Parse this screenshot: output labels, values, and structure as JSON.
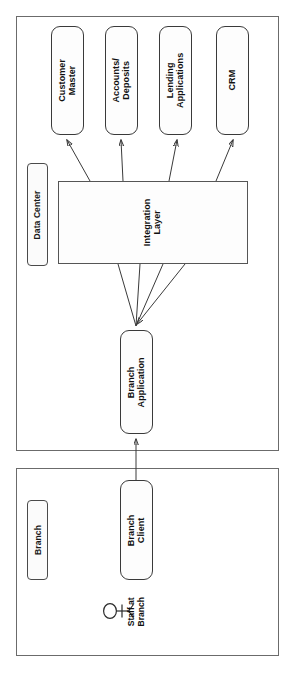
{
  "diagram": {
    "orientation": "rotated-90-ccw",
    "containers": [
      {
        "id": "data-center",
        "label": "Data Center"
      },
      {
        "id": "branch",
        "label": "Branch"
      }
    ],
    "nodes": [
      {
        "id": "customer-master",
        "label": "Customer\nMaster",
        "shape": "rounded-rect",
        "container": "data-center"
      },
      {
        "id": "accounts-deposits",
        "label": "Accounts/\nDeposits",
        "shape": "rounded-rect",
        "container": "data-center"
      },
      {
        "id": "lending-apps",
        "label": "Lending\nApplications",
        "shape": "rounded-rect",
        "container": "data-center"
      },
      {
        "id": "crm",
        "label": "CRM",
        "shape": "rounded-rect",
        "container": "data-center"
      },
      {
        "id": "integration-layer",
        "label": "Integration\nLayer",
        "shape": "rect",
        "container": "data-center"
      },
      {
        "id": "branch-app",
        "label": "Branch\nApplication",
        "shape": "rounded-rect",
        "container": "data-center"
      },
      {
        "id": "branch-client",
        "label": "Branch\nClient",
        "shape": "rounded-rect",
        "container": "branch"
      }
    ],
    "actors": [
      {
        "id": "staff-at-branch",
        "label": "Staff at\nBranch",
        "icon": "stick-figure-actor-icon",
        "container": "branch"
      }
    ],
    "edges": [
      {
        "from": "integration-layer",
        "to": "customer-master",
        "arrow": "end"
      },
      {
        "from": "integration-layer",
        "to": "accounts-deposits",
        "arrow": "end"
      },
      {
        "from": "integration-layer",
        "to": "lending-apps",
        "arrow": "end"
      },
      {
        "from": "integration-layer",
        "to": "crm",
        "arrow": "end"
      },
      {
        "from": "integration-layer",
        "to": "branch-app",
        "arrow": "end",
        "count": 4
      },
      {
        "from": "branch-client",
        "to": "branch-app",
        "arrow": "end"
      }
    ],
    "colors": {
      "stroke": "#3a3a3a",
      "container_stroke": "#6b6b6b",
      "node_fill": "#fdfdfd",
      "chip_fill": "#fbfbfb",
      "background": "#ffffff",
      "text": "#111111"
    }
  }
}
